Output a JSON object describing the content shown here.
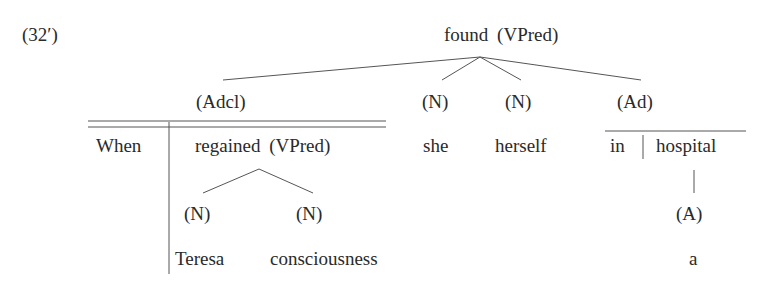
{
  "example_label": "(32′)",
  "root": {
    "word": "found",
    "category": "(VPred)"
  },
  "level1": {
    "adcl_label": "(Adcl)",
    "n1_label": "(N)",
    "n2_label": "(N)",
    "ad_label": "(Ad)"
  },
  "row2": {
    "when": "When",
    "regained": "regained",
    "regained_category": "(VPred)",
    "she": "she",
    "herself": "herself",
    "in": "in",
    "hospital": "hospital"
  },
  "level3": {
    "n_teresa_label": "(N)",
    "n_consciousness_label": "(N)",
    "a_label": "(A)"
  },
  "row4": {
    "teresa": "Teresa",
    "consciousness": "consciousness",
    "a": "a"
  }
}
